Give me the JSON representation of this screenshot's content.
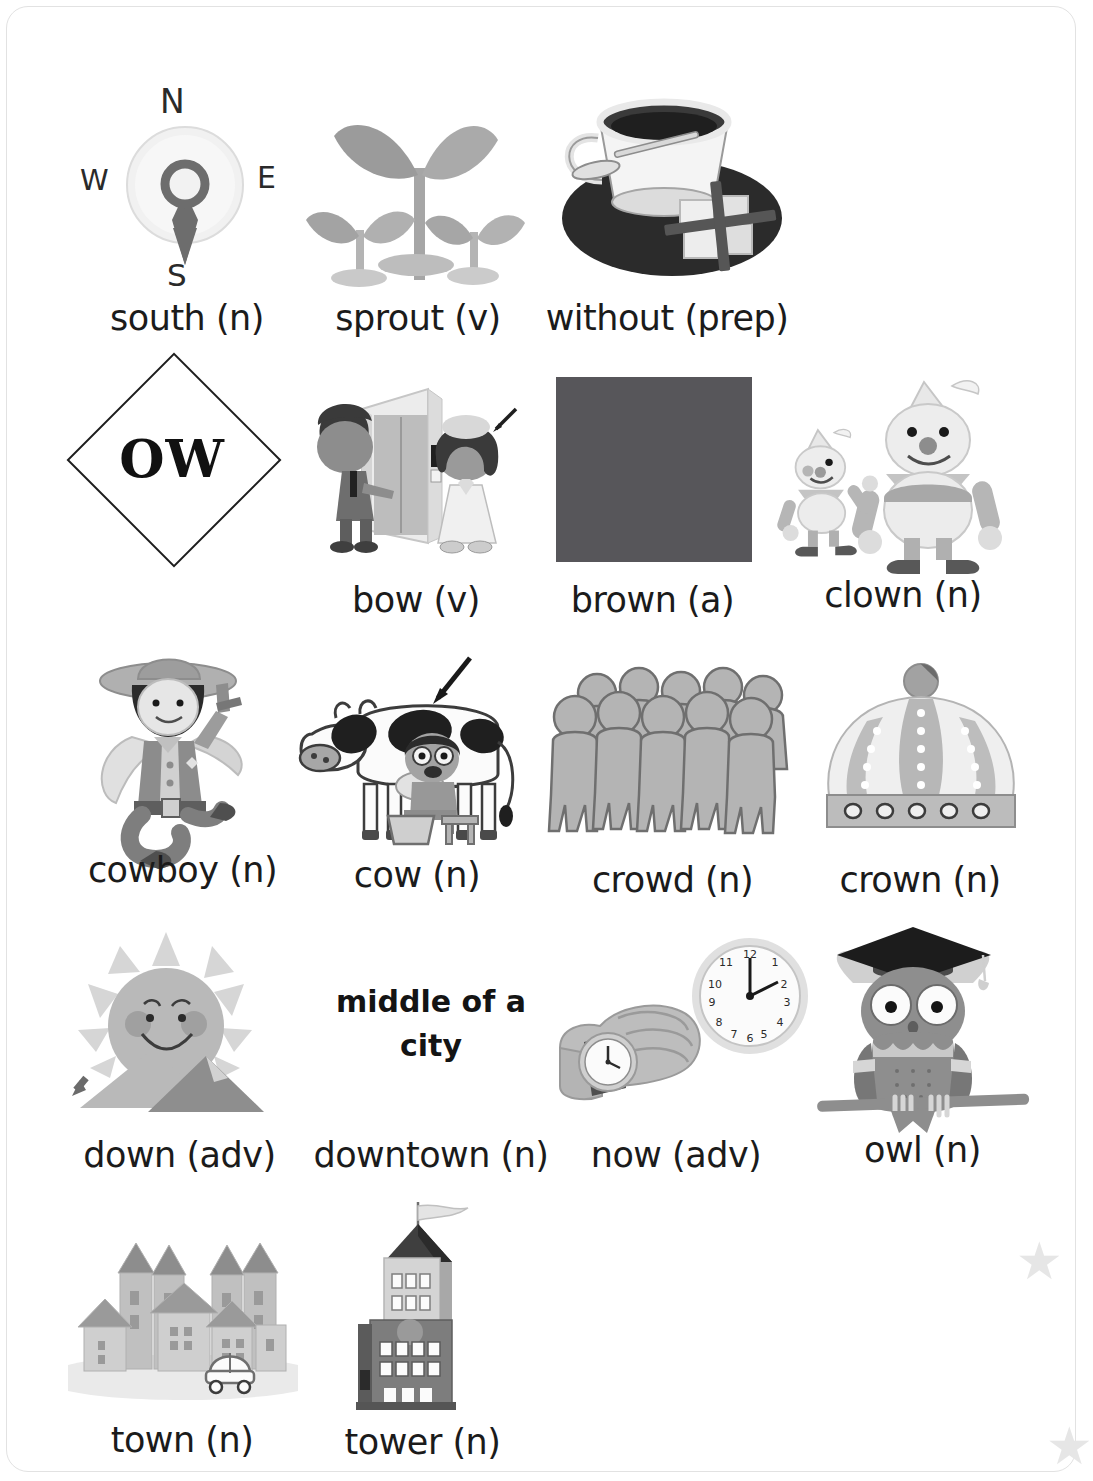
{
  "page": {
    "kind": "vocabulary-flashcard-worksheet",
    "phonics_focus": "OW",
    "background_color": "#ffffff",
    "text_color": "#1b1b1b"
  },
  "decor": {
    "star_glyph": "★",
    "star_color": "#e6e6e6"
  },
  "compass": {
    "north": "N",
    "west": "W",
    "east": "E",
    "south": "S"
  },
  "clock": {
    "numbers": [
      "12",
      "1",
      "2",
      "3",
      "4",
      "5",
      "6",
      "7",
      "8",
      "9",
      "10",
      "11"
    ],
    "time_shown": "12:10"
  },
  "entries": [
    {
      "id": "south",
      "word": "south",
      "pos": "(n)",
      "label": "south (n)",
      "icon": "compass-icon",
      "row": 1,
      "col": 1
    },
    {
      "id": "sprout",
      "word": "sprout",
      "pos": "(v)",
      "label": "sprout (v)",
      "icon": "seedling-icon",
      "row": 1,
      "col": 2
    },
    {
      "id": "without",
      "word": "without",
      "pos": "(prep)",
      "label": "without (prep)",
      "icon": "teacup-no-sugar-icon",
      "row": 1,
      "col": 3
    },
    {
      "id": "ow",
      "word": "OW",
      "pos": "",
      "label": "OW",
      "icon": "diamond-shape",
      "row": 2,
      "col": 1
    },
    {
      "id": "bow",
      "word": "bow",
      "pos": "(v)",
      "label": "bow (v)",
      "icon": "people-bowing-elevator-icon",
      "row": 2,
      "col": 2
    },
    {
      "id": "brown",
      "word": "brown",
      "pos": "(a)",
      "label": "brown (a)",
      "icon": "color-swatch-icon",
      "swatch_color": "#57565a",
      "row": 2,
      "col": 3
    },
    {
      "id": "clown",
      "word": "clown",
      "pos": "(n)",
      "label": "clown (n)",
      "icon": "clowns-icon",
      "row": 2,
      "col": 4
    },
    {
      "id": "cowboy",
      "word": "cowboy",
      "pos": "(n)",
      "label": "cowboy (n)",
      "icon": "cowboy-icon",
      "row": 3,
      "col": 1
    },
    {
      "id": "cow",
      "word": "cow",
      "pos": "(n)",
      "label": "cow (n)",
      "icon": "cow-milking-icon",
      "row": 3,
      "col": 2
    },
    {
      "id": "crowd",
      "word": "crowd",
      "pos": "(n)",
      "label": "crowd (n)",
      "icon": "crowd-icon",
      "row": 3,
      "col": 3
    },
    {
      "id": "crown",
      "word": "crown",
      "pos": "(n)",
      "label": "crown (n)",
      "icon": "crown-icon",
      "row": 3,
      "col": 4
    },
    {
      "id": "down",
      "word": "down",
      "pos": "(adv)",
      "label": "down (adv)",
      "icon": "sun-setting-mountain-icon",
      "row": 4,
      "col": 1
    },
    {
      "id": "downtown",
      "word": "downtown",
      "pos": "(n)",
      "label": "downtown (n)",
      "icon": "text-definition",
      "definition_line1": "middle of a",
      "definition_line2": "city",
      "row": 4,
      "col": 2
    },
    {
      "id": "now",
      "word": "now",
      "pos": "(adv)",
      "label": "now (adv)",
      "icon": "wristwatch-clock-icon",
      "row": 4,
      "col": 3
    },
    {
      "id": "owl",
      "word": "owl",
      "pos": "(n)",
      "label": "owl (n)",
      "icon": "owl-graduate-icon",
      "row": 4,
      "col": 4
    },
    {
      "id": "town",
      "word": "town",
      "pos": "(n)",
      "label": "town (n)",
      "icon": "town-houses-icon",
      "row": 5,
      "col": 1
    },
    {
      "id": "tower",
      "word": "tower",
      "pos": "(n)",
      "label": "tower (n)",
      "icon": "tower-building-icon",
      "row": 5,
      "col": 2
    }
  ]
}
